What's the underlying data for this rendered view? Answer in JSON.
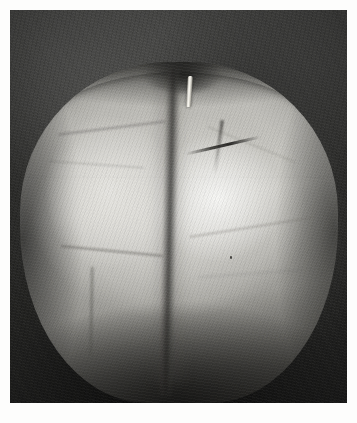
{
  "image": {
    "subject": "apple",
    "medium": "graphite-drawing-grayscale-photograph",
    "orientation": "portrait",
    "caption": "",
    "alt_text": "Grayscale study of a single apple with a vertical crease dividing two lobes, short stem at the top, set against a dark mottled background."
  },
  "canvas": {
    "width_px": 357,
    "height_px": 423,
    "paper_color": "#fdfdfc",
    "margin_px": 10
  },
  "plate": {
    "x": 10,
    "y": 10,
    "width": 337,
    "height": 393,
    "background_color": "#343432",
    "background_color_dark": "#252524",
    "background_color_light": "#3d3d3b"
  },
  "subject": {
    "name": "apple",
    "x": 10,
    "y": 52,
    "width": 318,
    "height": 341,
    "body_midtone": "#bdbcb7",
    "body_highlight": "#f2f2f0",
    "body_shadow": "#3b3a37",
    "rim_line_color": "#141413"
  },
  "features": [
    {
      "name": "stem",
      "label": "stem",
      "tone": "#f3f1ea"
    },
    {
      "name": "central-crease",
      "label": "central vertical crease",
      "tone": "#2a2927"
    },
    {
      "name": "left-lobe",
      "label": "left lobe",
      "tone": "#e2e1dd"
    },
    {
      "name": "right-lobe",
      "label": "right lobe highlight",
      "tone": "#f2f2f0"
    },
    {
      "name": "shoulder-rim",
      "label": "top shoulder rim",
      "tone": "#141413"
    },
    {
      "name": "blemish-mark",
      "label": "dark diagonal blemish",
      "tone": "#262523"
    },
    {
      "name": "base-shadow",
      "label": "base shadow",
      "tone": "#16161 5"
    }
  ]
}
